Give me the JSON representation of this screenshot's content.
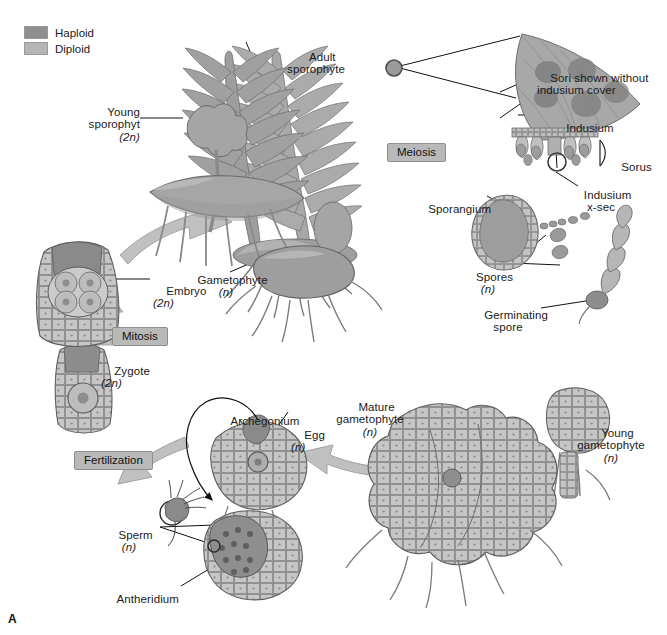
{
  "figure": {
    "panel_letter": "A"
  },
  "legend": {
    "items": [
      {
        "label": "Haploid",
        "color": "#8f8f8f"
      },
      {
        "label": "Diploid",
        "color": "#b5b5b5"
      }
    ]
  },
  "process_boxes": [
    {
      "name": "meiosis",
      "label": "Meiosis"
    },
    {
      "name": "mitosis",
      "label": "Mitosis"
    },
    {
      "name": "fertilization",
      "label": "Fertilization"
    }
  ],
  "labels": {
    "adult_sporophyte": {
      "line1": "Adult",
      "line2": "sporophyte"
    },
    "young_sporophyte": {
      "line1": "Young",
      "line2": "sporophyt",
      "ploidy": "(2n)"
    },
    "embryo": {
      "line1": "Embryo",
      "ploidy": "(2n)"
    },
    "zygote": {
      "line1": "Zygote",
      "ploidy": "(2n)"
    },
    "gametophyte": {
      "line1": "Gametophyte",
      "ploidy": "(n)"
    },
    "sori": {
      "line1": "Sori shown without",
      "line2": "indusium cover"
    },
    "indusium": {
      "line1": "Indusium"
    },
    "sorus": {
      "line1": "Sorus"
    },
    "indusium_xsec": {
      "line1": "Indusium",
      "line2": "x-sec"
    },
    "sporangium": {
      "line1": "Sporangium"
    },
    "spores": {
      "line1": "Spores",
      "ploidy": "(n)"
    },
    "germinating_spore": {
      "line1": "Germinating",
      "line2": "spore"
    },
    "young_gametophyte": {
      "line1": "Young",
      "line2": "gametophyte",
      "ploidy": "(n)"
    },
    "mature_gametophyte": {
      "line1": "Mature",
      "line2": "gametophyte",
      "ploidy": "(n)"
    },
    "archegonium": {
      "line1": "Archegonium"
    },
    "egg": {
      "line1": "Egg",
      "ploidy": "(n)"
    },
    "sperm": {
      "line1": "Sperm",
      "ploidy": "(n)"
    },
    "antheridium": {
      "line1": "Antheridium"
    }
  },
  "colors": {
    "haploid": "#8f8f8f",
    "diploid": "#b5b5b5",
    "plant_mid": "#a3a3a3",
    "plant_dark": "#7d7d7d",
    "plant_light": "#c9c9c9",
    "outline": "#5c5c5c",
    "arrow_fill": "#bdbdbd",
    "arrow_stroke": "#9a9a9a",
    "leader": "#111111",
    "background": "#ffffff"
  }
}
